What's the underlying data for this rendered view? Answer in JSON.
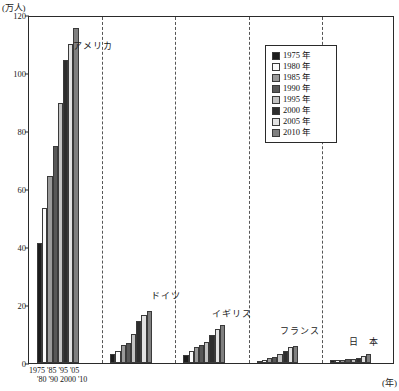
{
  "axes": {
    "y_unit_label": "(万人)",
    "x_unit_label": "(年)",
    "y_ticks": [
      "0",
      "20",
      "40",
      "60",
      "80",
      "100",
      "120"
    ],
    "x_tick_row_top": "1975 '85  '95  '05",
    "x_tick_row_bottom": "'80  '90 2000 '10"
  },
  "legend": {
    "items": [
      {
        "label": "1975 年",
        "color": "#1c1c1c"
      },
      {
        "label": "1980 年",
        "color": "#fbfbfb"
      },
      {
        "label": "1985 年",
        "color": "#9a9a9a"
      },
      {
        "label": "1990 年",
        "color": "#585858"
      },
      {
        "label": "1995 年",
        "color": "#c3c3c3"
      },
      {
        "label": "2000 年",
        "color": "#2e2e2e"
      },
      {
        "label": "2005 年",
        "color": "#e2e2e2"
      },
      {
        "label": "2010 年",
        "color": "#808080"
      }
    ]
  },
  "countries": [
    {
      "name": "アメリカ",
      "caption_x_pct": 17.5,
      "caption_y_px": 22
    },
    {
      "name": "ドイツ",
      "caption_x_pct": 37.5,
      "caption_y_px": 272
    },
    {
      "name": "イギリス",
      "caption_x_pct": 55.5,
      "caption_y_px": 290
    },
    {
      "name": "フランス",
      "caption_x_pct": 74.0,
      "caption_y_px": 307
    },
    {
      "name": "日　本",
      "caption_x_pct": 91.5,
      "caption_y_px": 318
    }
  ],
  "chart_data": {
    "type": "bar",
    "title": "",
    "xlabel": "(年)",
    "ylabel": "(万人)",
    "ylim": [
      0,
      120
    ],
    "ytick_step": 20,
    "grid": false,
    "legend_position": "top-right",
    "categories": [
      "アメリカ",
      "ドイツ",
      "イギリス",
      "フランス",
      "日本"
    ],
    "series": [
      {
        "name": "1975 年",
        "color": "#1c1c1c",
        "values": [
          41.5,
          3.2,
          2.9,
          0.8,
          0.9
        ]
      },
      {
        "name": "1980 年",
        "color": "#fbfbfb",
        "values": [
          53.5,
          4.3,
          4.0,
          1.2,
          0.9
        ]
      },
      {
        "name": "1985 年",
        "color": "#9a9a9a",
        "values": [
          64.5,
          6.3,
          5.6,
          1.7,
          1.1
        ]
      },
      {
        "name": "1990 年",
        "color": "#585858",
        "values": [
          75.0,
          6.9,
          6.1,
          2.1,
          1.3
        ]
      },
      {
        "name": "1995 年",
        "color": "#c3c3c3",
        "values": [
          89.5,
          10.0,
          7.2,
          3.1,
          1.4
        ]
      },
      {
        "name": "2000 年",
        "color": "#2e2e2e",
        "values": [
          104.5,
          14.5,
          9.8,
          4.0,
          1.6
        ]
      },
      {
        "name": "2005 年",
        "color": "#e2e2e2",
        "values": [
          110.0,
          16.6,
          11.9,
          5.6,
          2.3
        ]
      },
      {
        "name": "2010 年",
        "color": "#808080",
        "values": [
          115.5,
          17.9,
          13.2,
          5.7,
          3.0
        ]
      }
    ]
  }
}
